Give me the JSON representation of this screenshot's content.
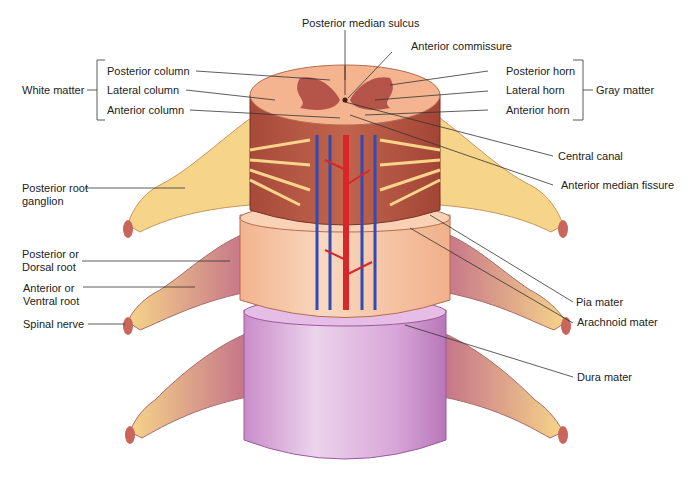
{
  "labels": {
    "posterior_median_sulcus": "Posterior median sulcus",
    "anterior_commissure": "Anterior commissure",
    "white_matter": "White matter",
    "posterior_column": "Posterior column",
    "lateral_column": "Lateral column",
    "anterior_column": "Anterior column",
    "gray_matter": "Gray matter",
    "posterior_horn": "Posterior horn",
    "lateral_horn": "Lateral horn",
    "anterior_horn": "Anterior horn",
    "central_canal": "Central canal",
    "anterior_median_fissure": "Anterior median fissure",
    "posterior_root_ganglion": "Posterior root\nganglion",
    "posterior_dorsal_root": "Posterior or\nDorsal root",
    "anterior_ventral_root": "Anterior or\nVentral root",
    "spinal_nerve": "Spinal nerve",
    "pia_mater": "Pia mater",
    "arachnoid_mater": "Arachnoid mater",
    "dura_mater": "Dura mater"
  },
  "colors": {
    "white_matter": "#f3b48f",
    "gray_matter": "#b5554a",
    "pia_layer": "#b85a44",
    "arachnoid_layer": "#f7c9a8",
    "dura_layer": "#ddb0dd",
    "nerve": "#f6d489",
    "artery": "#d9262a",
    "vein": "#2f4bb8",
    "leader_line": "#333333"
  }
}
